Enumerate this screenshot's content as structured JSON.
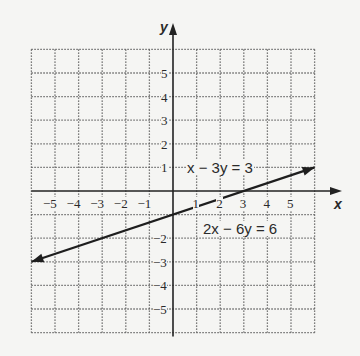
{
  "chart_data": {
    "type": "line",
    "title": "",
    "xlabel": "x",
    "ylabel": "y",
    "xlim": [
      -6,
      6
    ],
    "ylim": [
      -6,
      6
    ],
    "grid": true,
    "grid_style": "dotted",
    "x_ticks": [
      "-5",
      "-4",
      "-3",
      "-2",
      "-1",
      "1",
      "2",
      "3",
      "4",
      "5"
    ],
    "y_ticks": [
      "5",
      "4",
      "3",
      "2",
      "1",
      "-2",
      "-3",
      "-4",
      "-5"
    ],
    "series": [
      {
        "name": "x - 3y = 3 / 2x - 6y = 6",
        "x": [
          -6,
          6
        ],
        "y": [
          -3,
          1
        ],
        "arrows_both_ends": true
      }
    ],
    "annotations": [
      {
        "text": "x − 3y = 3",
        "x": 2.5,
        "y": 1.3
      },
      {
        "text": "2x − 6y = 6",
        "x": 3.2,
        "y": -1.2
      }
    ]
  },
  "labels": {
    "x_axis": "x",
    "y_axis": "y",
    "eq1": "x − 3y = 3",
    "eq2": "2x − 6y = 6",
    "xt": [
      "−5",
      "−4",
      "−3",
      "−2",
      "−1",
      "1",
      "2",
      "3",
      "4",
      "5"
    ],
    "yt": [
      "5",
      "4",
      "3",
      "2",
      "1",
      "−2",
      "−3",
      "−4",
      "−5"
    ]
  }
}
